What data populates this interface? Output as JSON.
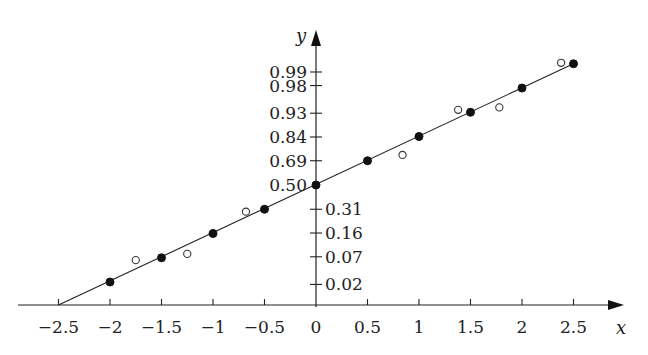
{
  "chart_data": {
    "type": "scatter",
    "title": "",
    "xlabel": "x",
    "ylabel": "y",
    "xlim": [
      -2.5,
      2.8
    ],
    "x_ticks": [
      -2.5,
      -2,
      -1.5,
      -1,
      -0.5,
      0,
      0.5,
      1,
      1.5,
      2,
      2.5
    ],
    "x_tick_labels": [
      "−2.5",
      "−2",
      "−1.5",
      "−1",
      "−0.5",
      "0",
      "0.5",
      "1",
      "1.5",
      "2",
      "2.5"
    ],
    "y_scale": "normal-probability",
    "y_ticks_upper": [
      {
        "label": "0.99",
        "z": 2.33
      },
      {
        "label": "0.98",
        "z": 2.05
      },
      {
        "label": "0.93",
        "z": 1.48
      },
      {
        "label": "0.84",
        "z": 0.99
      },
      {
        "label": "0.69",
        "z": 0.5
      },
      {
        "label": "0.50",
        "z": 0.0
      }
    ],
    "y_ticks_lower": [
      {
        "label": "0.31",
        "z": -0.5
      },
      {
        "label": "0.16",
        "z": -0.99
      },
      {
        "label": "0.07",
        "z": -1.48
      },
      {
        "label": "0.02",
        "z": -2.05
      }
    ],
    "fit_line": {
      "x": [
        -2.5,
        2.5
      ],
      "z": [
        -2.5,
        2.5
      ]
    },
    "series": [
      {
        "name": "filled",
        "marker": "filled-circle",
        "points": [
          {
            "x": -2.0,
            "z": -2.0
          },
          {
            "x": -1.5,
            "z": -1.5
          },
          {
            "x": -1.0,
            "z": -1.0
          },
          {
            "x": -0.5,
            "z": -0.5
          },
          {
            "x": 0.0,
            "z": 0.0
          },
          {
            "x": 0.5,
            "z": 0.5
          },
          {
            "x": 1.0,
            "z": 1.0
          },
          {
            "x": 1.5,
            "z": 1.5
          },
          {
            "x": 2.0,
            "z": 2.0
          },
          {
            "x": 2.5,
            "z": 2.5
          }
        ]
      },
      {
        "name": "open",
        "marker": "open-circle",
        "points": [
          {
            "x": -1.75,
            "z": -1.55
          },
          {
            "x": -1.25,
            "z": -1.42
          },
          {
            "x": -0.68,
            "z": -0.55
          },
          {
            "x": 0.84,
            "z": 0.62
          },
          {
            "x": 1.38,
            "z": 1.55
          },
          {
            "x": 1.78,
            "z": 1.6
          },
          {
            "x": 2.38,
            "z": 2.52
          }
        ]
      }
    ],
    "grid": false,
    "legend": "none"
  }
}
